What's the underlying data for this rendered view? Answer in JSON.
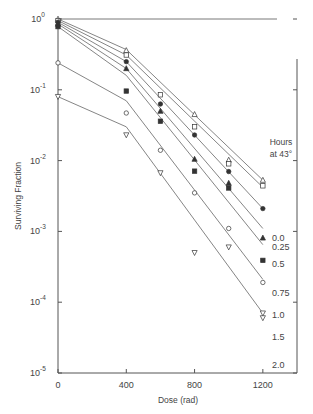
{
  "chart_data": {
    "type": "scatter",
    "title": "",
    "xlabel": "Dose (rad)",
    "ylabel": "Surviving Fraction",
    "yscale": "log",
    "xlim": [
      0,
      1400
    ],
    "ylim": [
      1e-05,
      1
    ],
    "xticks": [
      0,
      400,
      800,
      1200
    ],
    "xtick_labels": [
      "0",
      "400",
      "800",
      "1200"
    ],
    "yticks": [
      1,
      0.1,
      0.01,
      0.001,
      0.0001,
      1e-05
    ],
    "ytick_labels": [
      {
        "base": "10",
        "exp": "0"
      },
      {
        "base": "10",
        "exp": "-1"
      },
      {
        "base": "10",
        "exp": "-2"
      },
      {
        "base": "10",
        "exp": "-3"
      },
      {
        "base": "10",
        "exp": "-4"
      },
      {
        "base": "10",
        "exp": "-5"
      }
    ],
    "legend_title": [
      "Hours",
      "at 43°"
    ],
    "legend_position": "right, inline at line ends",
    "grid": false,
    "series": [
      {
        "name": "0.0",
        "marker": "triangle-open",
        "points": [
          [
            0,
            1.0
          ],
          [
            400,
            0.36
          ],
          [
            800,
            0.045
          ],
          [
            1000,
            0.0102
          ],
          [
            1200,
            0.0053
          ]
        ],
        "fit": [
          [
            0,
            1.0
          ],
          [
            400,
            0.37
          ],
          [
            1200,
            0.0053
          ]
        ]
      },
      {
        "name": "0.25",
        "marker": "square-open",
        "points": [
          [
            0,
            0.95
          ],
          [
            400,
            0.31
          ],
          [
            600,
            0.085
          ],
          [
            800,
            0.03
          ],
          [
            1000,
            0.009
          ],
          [
            1200,
            0.0044
          ]
        ],
        "fit": [
          [
            0,
            0.95
          ],
          [
            400,
            0.31
          ],
          [
            1200,
            0.0042
          ]
        ]
      },
      {
        "name": "0.5",
        "marker": "circle-filled",
        "points": [
          [
            0,
            0.9
          ],
          [
            400,
            0.25
          ],
          [
            600,
            0.063
          ],
          [
            800,
            0.023
          ],
          [
            1000,
            0.007
          ],
          [
            1200,
            0.0021
          ]
        ],
        "fit": [
          [
            0,
            0.9
          ],
          [
            400,
            0.25
          ],
          [
            1200,
            0.0021
          ]
        ]
      },
      {
        "name": "0.75",
        "marker": "triangle-filled",
        "points": [
          [
            0,
            0.85
          ],
          [
            400,
            0.2
          ],
          [
            600,
            0.05
          ],
          [
            800,
            0.0105
          ],
          [
            1000,
            0.0048
          ],
          [
            1200,
            0.00081
          ]
        ],
        "fit": [
          [
            0,
            0.85
          ],
          [
            400,
            0.2
          ],
          [
            1200,
            0.0011
          ]
        ]
      },
      {
        "name": "1.0",
        "marker": "square-filled",
        "points": [
          [
            0,
            0.78
          ],
          [
            400,
            0.096
          ],
          [
            600,
            0.036
          ],
          [
            800,
            0.0071
          ],
          [
            1000,
            0.0041
          ],
          [
            1200,
            0.00039
          ]
        ],
        "fit": [
          [
            0,
            0.78
          ],
          [
            400,
            0.16
          ],
          [
            1200,
            0.00065
          ]
        ]
      },
      {
        "name": "1.5",
        "marker": "circle-open",
        "points": [
          [
            0,
            0.24
          ],
          [
            400,
            0.047
          ],
          [
            600,
            0.014
          ],
          [
            800,
            0.0035
          ],
          [
            1000,
            0.0011
          ],
          [
            1200,
            0.00019
          ]
        ],
        "fit": [
          [
            0,
            0.24
          ],
          [
            400,
            0.07
          ],
          [
            1200,
            0.00021
          ]
        ]
      },
      {
        "name": "2.0",
        "marker": "triangle-down-open",
        "points": [
          [
            0,
            0.08
          ],
          [
            400,
            0.023
          ],
          [
            600,
            0.0067
          ],
          [
            800,
            0.0005
          ],
          [
            1000,
            0.0006
          ],
          [
            1200,
            7e-05
          ],
          [
            1200,
            6e-05
          ]
        ],
        "fit": [
          [
            0,
            0.08
          ],
          [
            400,
            0.03
          ],
          [
            1200,
            7e-05
          ]
        ]
      }
    ]
  }
}
